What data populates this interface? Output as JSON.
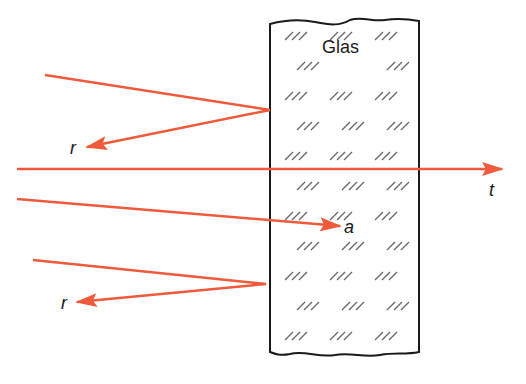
{
  "diagram": {
    "medium_label": "Glas",
    "ray_color": "#ee5a3a",
    "outline_color": "#1a1a1a",
    "hatch_color": "#555555",
    "labels": {
      "reflected_top": "r",
      "transmitted": "t",
      "absorbed": "a",
      "reflected_bottom": "r"
    },
    "rays": [
      {
        "type": "reflected",
        "incident_start": [
          45,
          75
        ],
        "hit": [
          270,
          110
        ],
        "end": [
          85,
          148
        ],
        "label": "r"
      },
      {
        "type": "transmitted",
        "start": [
          17,
          169
        ],
        "end": [
          502,
          169
        ],
        "label": "t"
      },
      {
        "type": "absorbed",
        "start": [
          17,
          199
        ],
        "end": [
          340,
          226
        ],
        "label": "a"
      },
      {
        "type": "reflected",
        "incident_start": [
          33,
          260
        ],
        "hit": [
          266,
          284
        ],
        "end": [
          75,
          303
        ],
        "label": "r"
      }
    ]
  }
}
